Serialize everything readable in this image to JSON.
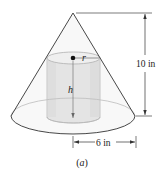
{
  "diagram": {
    "caption": "(a)",
    "cone": {
      "height_label": "10 in",
      "radius_label": "6 in"
    },
    "cylinder": {
      "radius_label": "r",
      "height_label": "h"
    },
    "colors": {
      "line": "#333333",
      "cylinder_fill": "#e6e6e6",
      "cylinder_stroke": "#b5b5b5",
      "cone_fill": "#f7f7f7"
    }
  }
}
